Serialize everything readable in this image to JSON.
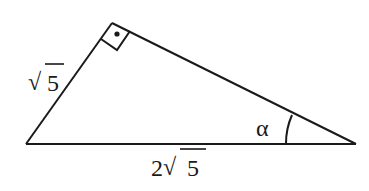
{
  "diagram": {
    "type": "right-triangle",
    "stroke_color": "#1a1a1a",
    "background": "#ffffff",
    "vertices": {
      "left": [
        26,
        144
      ],
      "top": [
        112,
        23
      ],
      "right": [
        356,
        144
      ]
    },
    "right_angle_at": "top",
    "labels": {
      "left_side": {
        "radicand": "5",
        "coefficient": "",
        "text": "√5"
      },
      "base": {
        "radicand": "5",
        "coefficient": "2",
        "text": "2√5"
      },
      "angle": {
        "symbol": "α",
        "at_vertex": "right"
      }
    }
  }
}
